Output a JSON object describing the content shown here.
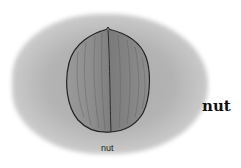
{
  "illustration": {
    "subject": "walnut",
    "icon": "walnut-icon",
    "background_color": "#ffffff",
    "blob_color": "#b0b0b0",
    "nut_color": "#8a8a8a",
    "outline_color": "#222222"
  },
  "labels": {
    "title": "nut",
    "caption": "nut"
  }
}
